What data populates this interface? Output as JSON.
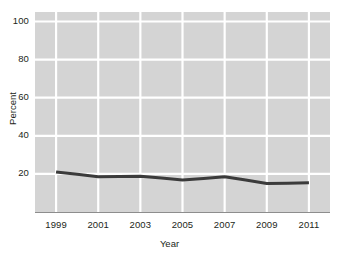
{
  "chart_data": {
    "type": "line",
    "title": "",
    "xlabel": "Year",
    "ylabel": "Percent",
    "x": [
      1999,
      2000,
      2001,
      2002,
      2003,
      2004,
      2005,
      2006,
      2007,
      2008,
      2009,
      2010,
      2011
    ],
    "values": [
      21.0,
      19.8,
      18.5,
      18.6,
      18.8,
      17.8,
      16.8,
      17.6,
      18.5,
      16.8,
      15.0,
      15.1,
      15.3
    ],
    "series": [
      {
        "name": "Percent",
        "color": "#3b3b3b",
        "values": [
          21.0,
          19.8,
          18.5,
          18.6,
          18.8,
          17.8,
          16.8,
          17.6,
          18.5,
          16.8,
          15.0,
          15.1,
          15.3
        ]
      }
    ],
    "xlim": [
      1998,
      2012
    ],
    "ylim": [
      0,
      105
    ],
    "xticks": [
      "1999",
      "2001",
      "2003",
      "2005",
      "2007",
      "2009",
      "2011"
    ],
    "xtick_values": [
      1999,
      2001,
      2003,
      2005,
      2007,
      2009,
      2011
    ],
    "yticks": [
      "100",
      "80",
      "60",
      "40",
      "20"
    ],
    "ytick_values": [
      100,
      80,
      60,
      40,
      20
    ],
    "grid": true,
    "grid_color": "#ffffff",
    "plot_background": "#d4d4d4",
    "legend": "none",
    "line_width": 3
  },
  "axes": {
    "y_title": "Percent",
    "x_title": "Year"
  },
  "ytick_labels": {
    "t0": "100",
    "t1": "80",
    "t2": "60",
    "t3": "40",
    "t4": "20"
  },
  "xtick_labels": {
    "t0": "1999",
    "t1": "2001",
    "t2": "2003",
    "t3": "2005",
    "t4": "2007",
    "t5": "2009",
    "t6": "2011"
  }
}
